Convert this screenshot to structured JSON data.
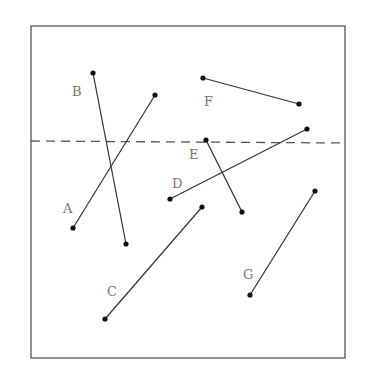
{
  "diagram": {
    "type": "line-segments-with-reference-line",
    "frame": {
      "x1": 31,
      "y1": 26,
      "x2": 345,
      "y2": 358
    },
    "reference_line": {
      "style": "dashed",
      "x1": 31,
      "y1": 141,
      "x2": 345,
      "y2": 143
    },
    "colors": {
      "frame": "#555555",
      "segment": "#333333",
      "endpoint": "#111111",
      "label": "#777777"
    },
    "segments": [
      {
        "label": "A",
        "x1": 73,
        "y1": 228,
        "x2": 155,
        "y2": 95,
        "label_x": 63,
        "label_y": 213
      },
      {
        "label": "B",
        "x1": 93,
        "y1": 73,
        "x2": 126,
        "y2": 244,
        "label_x": 72,
        "label_y": 96
      },
      {
        "label": "C",
        "x1": 105,
        "y1": 319,
        "x2": 202,
        "y2": 207,
        "label_x": 107,
        "label_y": 296
      },
      {
        "label": "D",
        "x1": 170,
        "y1": 199,
        "x2": 307,
        "y2": 129,
        "label_x": 172,
        "label_y": 188
      },
      {
        "label": "E",
        "x1": 206,
        "y1": 140,
        "x2": 242,
        "y2": 212,
        "label_x": 189,
        "label_y": 159
      },
      {
        "label": "F",
        "x1": 203,
        "y1": 78,
        "x2": 299,
        "y2": 104,
        "label_x": 204,
        "label_y": 106
      },
      {
        "label": "G",
        "x1": 250,
        "y1": 295,
        "x2": 315,
        "y2": 191,
        "label_x": 243,
        "label_y": 279
      }
    ]
  }
}
